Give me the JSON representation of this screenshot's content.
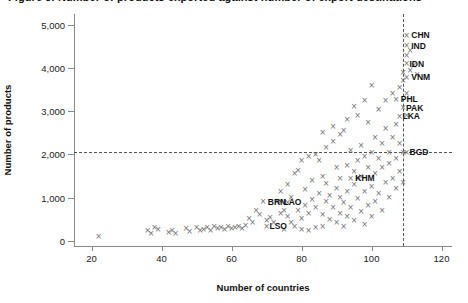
{
  "figure": {
    "title": "Figure 3. Number of products exported against number of export destinations"
  },
  "chart_data": {
    "type": "scatter",
    "title": "",
    "xlabel": "Number of countries",
    "ylabel": "Number of products",
    "xlim": [
      15,
      123
    ],
    "ylim": [
      -120,
      5250
    ],
    "xticks": [
      20,
      40,
      60,
      80,
      100,
      120
    ],
    "yticks": [
      0,
      1000,
      2000,
      3000,
      4000,
      5000
    ],
    "ytick_labels": [
      "0",
      "1,000",
      "2,000",
      "3,000",
      "4,000",
      "5,000"
    ],
    "xtick_labels": [
      "20",
      "40",
      "60",
      "80",
      "100",
      "120"
    ],
    "grid": false,
    "legend": null,
    "marker": "x",
    "marker_color": "#6e6e6e",
    "reference_lines": [
      {
        "orientation": "horizontal",
        "value": 2050,
        "style": "dashed",
        "color": "#555555"
      },
      {
        "orientation": "vertical",
        "value": 109,
        "style": "dashed",
        "color": "#555555"
      }
    ],
    "annotations": [
      {
        "label": "CHN",
        "x": 110.5,
        "y": 4760
      },
      {
        "label": "IND",
        "x": 110.5,
        "y": 4520
      },
      {
        "label": "IDN",
        "x": 110.0,
        "y": 4100
      },
      {
        "label": "VNM",
        "x": 110.5,
        "y": 3790
      },
      {
        "label": "PHL",
        "x": 107.5,
        "y": 3280
      },
      {
        "label": "PAK",
        "x": 109.0,
        "y": 3080
      },
      {
        "label": "LKA",
        "x": 108.0,
        "y": 2880
      },
      {
        "label": "BGD",
        "x": 110.0,
        "y": 2050
      },
      {
        "label": "KHM",
        "x": 94.5,
        "y": 1450
      },
      {
        "label": "BRN",
        "x": 69.5,
        "y": 900
      },
      {
        "label": "LAO",
        "x": 74.0,
        "y": 900
      },
      {
        "label": "LSO",
        "x": 70.0,
        "y": 340
      }
    ],
    "points": [
      [
        22,
        100
      ],
      [
        36,
        230
      ],
      [
        37,
        180
      ],
      [
        38,
        300
      ],
      [
        39,
        260
      ],
      [
        42,
        200
      ],
      [
        43,
        250
      ],
      [
        44,
        180
      ],
      [
        47,
        280
      ],
      [
        48,
        220
      ],
      [
        50,
        300
      ],
      [
        51,
        250
      ],
      [
        52,
        260
      ],
      [
        53,
        300
      ],
      [
        54,
        240
      ],
      [
        55,
        320
      ],
      [
        56,
        280
      ],
      [
        57,
        300
      ],
      [
        58,
        260
      ],
      [
        59,
        320
      ],
      [
        60,
        280
      ],
      [
        61,
        300
      ],
      [
        62,
        330
      ],
      [
        63,
        290
      ],
      [
        64,
        360
      ],
      [
        65,
        520
      ],
      [
        66,
        430
      ],
      [
        67,
        700
      ],
      [
        68,
        620
      ],
      [
        69,
        900
      ],
      [
        70,
        340
      ],
      [
        70,
        480
      ],
      [
        71,
        550
      ],
      [
        72,
        420
      ],
      [
        73,
        900
      ],
      [
        74,
        900
      ],
      [
        74,
        640
      ],
      [
        75,
        260
      ],
      [
        75,
        700
      ],
      [
        76,
        560
      ],
      [
        76,
        880
      ],
      [
        77,
        430
      ],
      [
        77,
        1000
      ],
      [
        78,
        330
      ],
      [
        79,
        700
      ],
      [
        79,
        1630
      ],
      [
        80,
        260
      ],
      [
        80,
        520
      ],
      [
        81,
        820
      ],
      [
        81,
        1180
      ],
      [
        82,
        240
      ],
      [
        82,
        640
      ],
      [
        83,
        960
      ],
      [
        83,
        1400
      ],
      [
        84,
        300
      ],
      [
        84,
        780
      ],
      [
        85,
        1100
      ],
      [
        85,
        1870
      ],
      [
        86,
        340
      ],
      [
        86,
        620
      ],
      [
        86,
        1500
      ],
      [
        87,
        900
      ],
      [
        87,
        1320
      ],
      [
        88,
        500
      ],
      [
        88,
        1050
      ],
      [
        89,
        760
      ],
      [
        89,
        2300
      ],
      [
        90,
        420
      ],
      [
        90,
        1200
      ],
      [
        90,
        1700
      ],
      [
        91,
        640
      ],
      [
        91,
        1000
      ],
      [
        91,
        1450
      ],
      [
        92,
        320
      ],
      [
        92,
        880
      ],
      [
        92,
        2560
      ],
      [
        93,
        1150
      ],
      [
        93,
        1750
      ],
      [
        93,
        560
      ],
      [
        94,
        760
      ],
      [
        94,
        1450
      ],
      [
        94,
        2100
      ],
      [
        95,
        460
      ],
      [
        95,
        1300
      ],
      [
        95,
        1600
      ],
      [
        96,
        980
      ],
      [
        96,
        1850
      ],
      [
        96,
        1450
      ],
      [
        97,
        680
      ],
      [
        97,
        1500
      ],
      [
        97,
        2200
      ],
      [
        98,
        380
      ],
      [
        98,
        1150
      ],
      [
        98,
        1950
      ],
      [
        99,
        820
      ],
      [
        99,
        1700
      ],
      [
        99,
        2750
      ],
      [
        100,
        1250
      ],
      [
        100,
        2050
      ],
      [
        100,
        560
      ],
      [
        101,
        900
      ],
      [
        101,
        1550
      ],
      [
        101,
        2400
      ],
      [
        102,
        1100
      ],
      [
        102,
        1900
      ],
      [
        102,
        3050
      ],
      [
        103,
        700
      ],
      [
        103,
        1700
      ],
      [
        103,
        2250
      ],
      [
        104,
        1350
      ],
      [
        104,
        2600
      ],
      [
        104,
        3250
      ],
      [
        105,
        1000
      ],
      [
        105,
        1800
      ],
      [
        105,
        2050
      ],
      [
        106,
        1450
      ],
      [
        106,
        2400
      ],
      [
        106,
        3400
      ],
      [
        107,
        1200
      ],
      [
        107,
        1900
      ],
      [
        107,
        2700
      ],
      [
        107,
        3280
      ],
      [
        108,
        1600
      ],
      [
        108,
        2250
      ],
      [
        108,
        2880
      ],
      [
        108,
        3550
      ],
      [
        109,
        1350
      ],
      [
        109,
        2050
      ],
      [
        109,
        3080
      ],
      [
        109,
        3700
      ],
      [
        109,
        3900
      ],
      [
        110,
        2900
      ],
      [
        110,
        3400
      ],
      [
        110,
        4100
      ],
      [
        110,
        4300
      ],
      [
        110,
        4520
      ],
      [
        110,
        4760
      ],
      [
        110,
        3790
      ],
      [
        110,
        2050
      ],
      [
        111,
        3950
      ],
      [
        111,
        4400
      ],
      [
        112,
        4050
      ],
      [
        113,
        3850
      ],
      [
        100,
        3600
      ],
      [
        98,
        3250
      ],
      [
        96,
        2900
      ],
      [
        95,
        3100
      ],
      [
        93,
        2800
      ],
      [
        91,
        2450
      ],
      [
        89,
        2650
      ],
      [
        87,
        2150
      ],
      [
        86,
        2500
      ],
      [
        84,
        2000
      ],
      [
        82,
        1950
      ],
      [
        80,
        1850
      ],
      [
        78,
        1550
      ],
      [
        76,
        1300
      ],
      [
        74,
        1150
      ]
    ]
  }
}
